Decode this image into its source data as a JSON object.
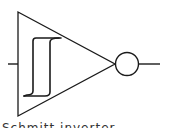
{
  "diagram": {
    "type": "logic-gate-symbol",
    "gate": "Schmitt trigger inverter",
    "label": "Schmitt inverter",
    "colors": {
      "stroke": "#1a1a1a",
      "background": "#ffffff"
    },
    "parts": [
      {
        "name": "input-line",
        "role": "input"
      },
      {
        "name": "buffer-triangle",
        "role": "gate-body"
      },
      {
        "name": "hysteresis-symbol",
        "role": "schmitt-indicator"
      },
      {
        "name": "inversion-bubble",
        "role": "negation"
      },
      {
        "name": "output-line",
        "role": "output"
      }
    ]
  }
}
